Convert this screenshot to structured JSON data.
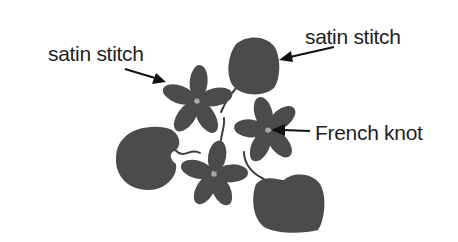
{
  "diagram": {
    "colors": {
      "background": "#ffffff",
      "fill": "#4b4b4b",
      "knot": "#a8a8a8",
      "text": "#1f1f1f",
      "arrow": "#111111"
    },
    "labels": [
      {
        "id": "label-left",
        "text": "satin stitch",
        "points_to": "flower-top-left petals"
      },
      {
        "id": "label-right",
        "text": "satin stitch",
        "points_to": "leaf-top"
      },
      {
        "id": "label-knot",
        "text": "French knot",
        "points_to": "flower-right center"
      }
    ],
    "elements": {
      "flowers": [
        "flower-top-left",
        "flower-right",
        "flower-bottom"
      ],
      "leaves": [
        "leaf-top",
        "leaf-left",
        "leaf-bottom"
      ],
      "flower_petal_count": 5
    }
  }
}
